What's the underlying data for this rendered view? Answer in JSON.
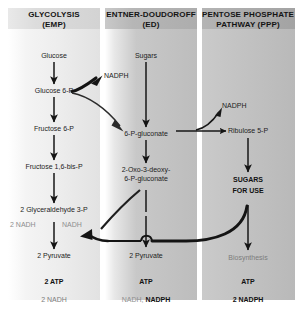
{
  "figure": {
    "type": "metabolic-pathway-diagram",
    "columns": [
      {
        "id": "glycolysis",
        "header_line1": "GLYCOLYSIS",
        "header_line2": "(EMP)",
        "nodes": [
          "Glucose",
          "Glucose 6-P",
          "Fructose 6-P",
          "Fructose 1,6-bis-P",
          "2 Glyceraldehyde 3-P",
          "2 Pyruvate"
        ],
        "cofactor_left": "2 NADH",
        "cofactor_right": "NADH",
        "yield_atp": "2  ATP",
        "yield_redox": "2 NADH"
      },
      {
        "id": "entner-doudoroff",
        "header_line1": "ENTNER-DOUDOROFF",
        "header_line2": "(ED)",
        "nodes": [
          "Sugars",
          "6-P-gluconate",
          "2-Oxo-3-deoxy-",
          "6-P-gluconate",
          "2 Pyruvate"
        ],
        "yield_atp": "ATP",
        "yield_redox_gray": "NADH,",
        "yield_redox_bold": "NADPH"
      },
      {
        "id": "pentose-phosphate",
        "header_line1": "PENTOSE PHOSPHATE",
        "header_line2": "PATHWAY (PPP)",
        "nodes": [
          "Ribulose 5-P",
          "SUGARS",
          "FOR USE",
          "Biosynthesis"
        ],
        "yield_atp": "ATP",
        "yield_redox": "2  NADPH"
      }
    ],
    "cofactor_labels": {
      "nadph_left": "NADPH",
      "nadph_right": "NADPH"
    },
    "colors": {
      "header_band": "#b9b9b9",
      "column_ed": "#c3c3c3",
      "column_ppp": "#c6c6c6",
      "arrow": "#1a1a1a",
      "muted_text": "#8e8e8e"
    }
  }
}
